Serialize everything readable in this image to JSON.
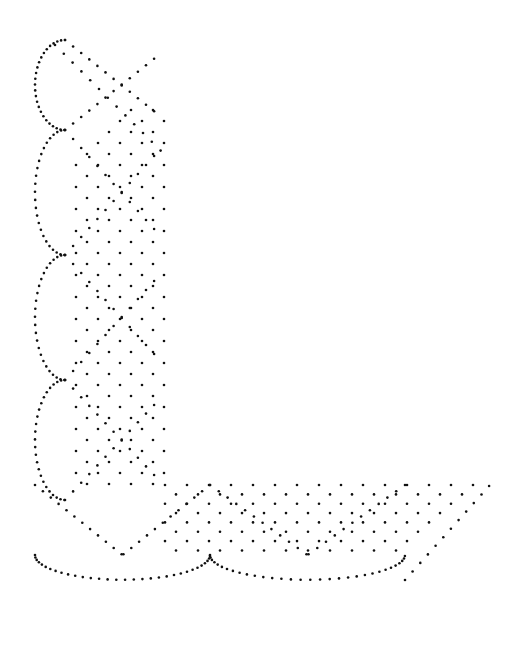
{
  "diagram": {
    "kind": "lace pricking pattern (dot grid corner)",
    "background": "#ffffff",
    "dot_color": "#111111",
    "vertical_band": {
      "x_left": 35,
      "x_right": 165,
      "y_top": 40,
      "y_bottom": 560,
      "scallops_left": [
        {
          "y0": 40,
          "y1": 130
        },
        {
          "y0": 130,
          "y1": 255
        },
        {
          "y0": 255,
          "y1": 380
        },
        {
          "y0": 380,
          "y1": 500
        }
      ]
    },
    "horizontal_band": {
      "x_left": 35,
      "x_right": 492,
      "y_top": 485,
      "y_bottom": 555,
      "scallops_bottom": [
        {
          "x0": 35,
          "x1": 210
        },
        {
          "x0": 210,
          "x1": 405
        }
      ]
    },
    "grid_spacing": 11
  }
}
